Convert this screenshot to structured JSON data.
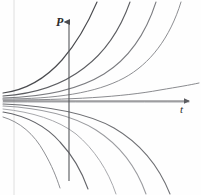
{
  "figure": {
    "background_color": "#fefefe",
    "width": 201,
    "height": 195
  },
  "axes": {
    "vertical": {
      "label": "P",
      "name": "vertical-axis",
      "color": "#55565a",
      "x": 69,
      "y_top": 22,
      "y_bottom": 181,
      "arrow": "up"
    },
    "horizontal": {
      "label": "t",
      "name": "horizontal-axis",
      "color": "#6a6b6f",
      "y": 101,
      "x_left": 3,
      "x_right": 189,
      "arrow": "right"
    },
    "origin": {
      "x": 69,
      "y": 101
    }
  },
  "guide_line": {
    "name": "margin-rule-line",
    "color": "#dcdcdc",
    "x": 14,
    "y_top": 0,
    "y_bottom": 195
  },
  "chart_data": {
    "type": "line",
    "xlabel": "t",
    "ylabel": "P",
    "grid": false,
    "legend": false,
    "xlim": [
      0,
      201
    ],
    "ylim": [
      195,
      0
    ],
    "note": "Hand-drawn family of exponential solution curves fanning out from a near-common left-edge origin; upper branch curves grow, lower branch curves decay downward.",
    "series": [
      {
        "name": "growth-curve-1",
        "direction": "up",
        "color": "#4a4b4f",
        "width": 1.15,
        "path": "M 3,93 C 26,90 46,78 62,60 C 76,44 88,23 97,2"
      },
      {
        "name": "growth-curve-2",
        "direction": "up",
        "color": "#5d5e62",
        "width": 1.1,
        "path": "M 3,96 C 34,94 62,85 84,68 C 104,53 120,30 130,2"
      },
      {
        "name": "growth-curve-3",
        "direction": "up",
        "color": "#7b7c80",
        "width": 1.05,
        "path": "M 3,98 C 44,97 78,90 104,74 C 128,59 146,33 156,2"
      },
      {
        "name": "growth-curve-4",
        "direction": "up",
        "color": "#8d8e92",
        "width": 1.0,
        "path": "M 3,99 C 56,99 96,93 124,78 C 150,64 170,38 181,2"
      },
      {
        "name": "growth-curve-5-flat",
        "direction": "up",
        "color": "#8a8b8f",
        "width": 1.0,
        "path": "M 3,100 C 70,100 122,97 160,90 C 178,87 190,85 199,83"
      },
      {
        "name": "equilibrium-curve",
        "direction": "flat",
        "color": "#9a9b9f",
        "width": 0.9,
        "path": "M 3,102 C 70,102 130,102 189,102"
      },
      {
        "name": "decay-curve-1",
        "direction": "down",
        "color": "#6f7074",
        "width": 1.05,
        "path": "M 3,104 C 48,106 86,112 114,128 C 138,142 158,164 170,194"
      },
      {
        "name": "decay-curve-2",
        "direction": "down",
        "color": "#9b9ca0",
        "width": 1.05,
        "path": "M 3,106 C 40,108 72,115 96,130 C 118,144 136,166 146,194"
      },
      {
        "name": "decay-curve-3",
        "direction": "down",
        "color": "#a8a9ad",
        "width": 1.0,
        "path": "M 3,109 C 32,112 58,120 76,134 C 94,149 108,170 116,194"
      },
      {
        "name": "decay-curve-4",
        "direction": "down",
        "color": "#64656a",
        "width": 1.1,
        "path": "M 3,112 C 26,116 46,126 60,142 C 74,157 82,172 88,189"
      },
      {
        "name": "decay-curve-5",
        "direction": "down",
        "color": "#8f9094",
        "width": 1.0,
        "path": "M 3,117 C 20,122 34,134 44,152 C 52,166 56,176 60,188"
      }
    ]
  }
}
